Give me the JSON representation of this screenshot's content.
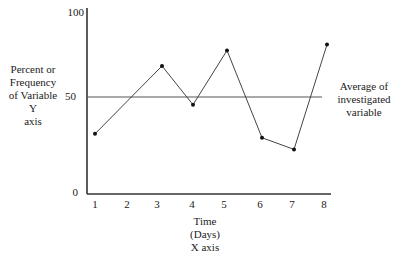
{
  "chart_data": {
    "type": "line",
    "title": "",
    "xlabel": [
      "Time",
      "(Days)",
      "X axis"
    ],
    "ylabel": [
      "Percent or",
      "Frequency",
      "of Variable",
      "Y",
      "axis"
    ],
    "x": [
      1,
      2,
      3,
      4,
      5,
      6,
      7,
      8
    ],
    "x_tick_labels": [
      "1",
      "2",
      "3",
      "4",
      "5",
      "6",
      "7",
      "8"
    ],
    "y_tick_labels": [
      "0",
      "50",
      "100"
    ],
    "ylim": [
      0,
      100
    ],
    "grid": false,
    "series": [
      {
        "name": "Investigated variable",
        "points": [
          {
            "x": 1,
            "y": 31
          },
          {
            "x": 3,
            "y": 66
          },
          {
            "x": 4,
            "y": 46
          },
          {
            "x": 5,
            "y": 74
          },
          {
            "x": 6,
            "y": 29
          },
          {
            "x": 7,
            "y": 23
          },
          {
            "x": 8,
            "y": 77
          }
        ]
      }
    ],
    "reference_line": {
      "y": 50,
      "label": [
        "Average of",
        "investigated",
        "variable"
      ]
    }
  }
}
